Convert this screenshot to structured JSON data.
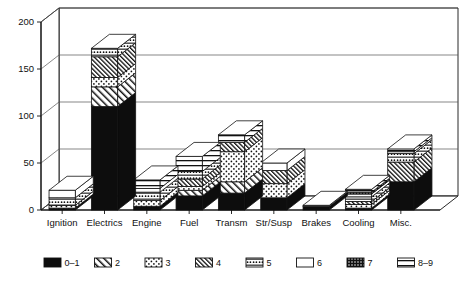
{
  "chart_data": {
    "type": "bar",
    "subtype": "stacked-3d-column",
    "title": "",
    "xlabel": "",
    "ylabel": "",
    "ylim": [
      0,
      200
    ],
    "yticks": [
      0,
      50,
      100,
      150,
      200
    ],
    "ytick_labels": [
      "0",
      "50",
      "100",
      "150",
      "200"
    ],
    "grid": true,
    "grid_axis": "y",
    "legend_position": "bottom",
    "categories": [
      "Ignition",
      "Electrics",
      "Engine",
      "Fuel",
      "Transm",
      "Str/Susp",
      "Brakes",
      "Cooling",
      "Misc."
    ],
    "series": [
      {
        "name": "0–1",
        "pattern": "solid-black",
        "values": [
          2,
          110,
          4,
          15,
          18,
          13,
          4,
          2,
          30
        ]
      },
      {
        "name": "2",
        "pattern": "diagonal-stripes",
        "values": [
          0,
          21,
          0,
          6,
          12,
          0,
          0,
          0,
          0
        ]
      },
      {
        "name": "3",
        "pattern": "dots",
        "values": [
          3,
          10,
          6,
          4,
          32,
          15,
          0,
          4,
          0
        ]
      },
      {
        "name": "4",
        "pattern": "dense-hatch",
        "values": [
          0,
          22,
          0,
          8,
          10,
          14,
          0,
          3,
          21
        ]
      },
      {
        "name": "5",
        "pattern": "dash-dots",
        "values": [
          8,
          9,
          9,
          8,
          0,
          0,
          0,
          5,
          9
        ]
      },
      {
        "name": "6",
        "pattern": "white",
        "values": [
          8,
          0,
          4,
          0,
          0,
          8,
          1,
          3,
          2
        ]
      },
      {
        "name": "7",
        "pattern": "heavy-dots",
        "values": [
          0,
          0,
          0,
          0,
          0,
          0,
          0,
          2,
          0
        ]
      },
      {
        "name": "8–9",
        "pattern": "horizontal-bands",
        "values": [
          0,
          0,
          9,
          16,
          8,
          0,
          0,
          3,
          3
        ]
      }
    ],
    "totals": [
      21,
      172,
      32,
      57,
      80,
      50,
      5,
      22,
      65
    ]
  },
  "legend": {
    "items": [
      {
        "label": "0–1",
        "pattern": "solid-black"
      },
      {
        "label": "2",
        "pattern": "diagonal-stripes"
      },
      {
        "label": "3",
        "pattern": "dots"
      },
      {
        "label": "4",
        "pattern": "dense-hatch"
      },
      {
        "label": "5",
        "pattern": "dash-dots"
      },
      {
        "label": "6",
        "pattern": "white"
      },
      {
        "label": "7",
        "pattern": "heavy-dots"
      },
      {
        "label": "8–9",
        "pattern": "horizontal-bands"
      }
    ]
  },
  "colors": {
    "ink": "#111111",
    "fill": "#ffffff",
    "black_fill": "#0d0d0d",
    "grid": "#555555"
  }
}
